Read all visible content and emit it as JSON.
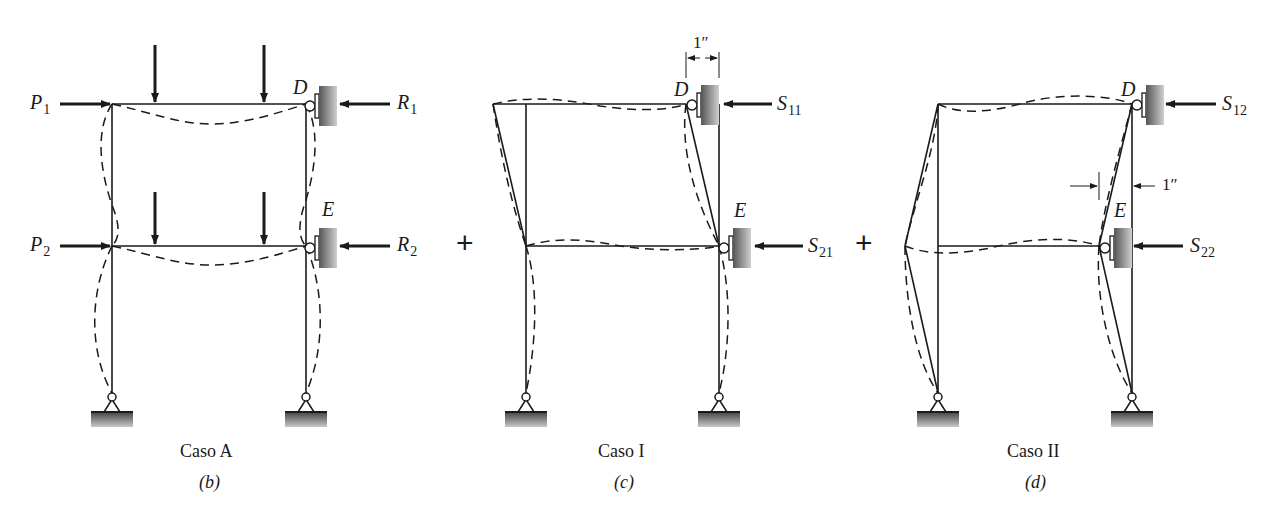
{
  "figure": {
    "panels": [
      {
        "id": "b",
        "caption": "Caso A",
        "sublabel": "(b)",
        "left_loads": [
          {
            "symbol": "P",
            "sub": "1"
          },
          {
            "symbol": "P",
            "sub": "2"
          }
        ],
        "right_reactions": [
          {
            "symbol": "R",
            "sub": "1"
          },
          {
            "symbol": "R",
            "sub": "2"
          }
        ],
        "joints": {
          "top": "D",
          "bottom": "E"
        }
      },
      {
        "id": "c",
        "caption": "Caso I",
        "sublabel": "(c)",
        "dimension": "1″",
        "right_reactions": [
          {
            "symbol": "S",
            "sub": "11"
          },
          {
            "symbol": "S",
            "sub": "21"
          }
        ],
        "joints": {
          "top": "D",
          "bottom": "E"
        }
      },
      {
        "id": "d",
        "caption": "Caso II",
        "sublabel": "(d)",
        "dimension": "1″",
        "right_reactions": [
          {
            "symbol": "S",
            "sub": "12"
          },
          {
            "symbol": "S",
            "sub": "22"
          }
        ],
        "joints": {
          "top": "D",
          "bottom": "E"
        }
      }
    ],
    "operators": [
      "+",
      "+"
    ],
    "colors": {
      "line": "#1a1a1a",
      "support_dark": "#555555",
      "support_light": "#c8c8c8",
      "background": "#ffffff"
    }
  }
}
